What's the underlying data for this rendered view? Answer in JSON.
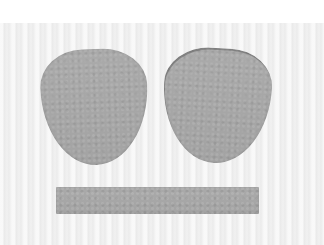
{
  "scene": {
    "description": "Photo of three grey felt cutouts on a light background",
    "background": {
      "top_band_color": "#ffffff",
      "surface_color": "#f1f1f1"
    },
    "pieces": [
      {
        "name": "left-rounded-piece",
        "shape": "rounded-triangle",
        "color": "#a8a8a8"
      },
      {
        "name": "right-rounded-piece",
        "shape": "rounded-triangle",
        "color": "#a8a8a8"
      },
      {
        "name": "bottom-strip",
        "shape": "rectangle",
        "color": "#adadad"
      }
    ]
  }
}
